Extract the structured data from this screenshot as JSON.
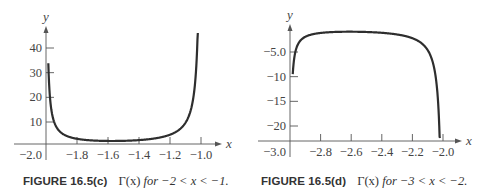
{
  "chart_data": [
    {
      "type": "line",
      "title": "",
      "caption_label": "FIGURE 16.5(c)",
      "caption_text": "Γ(x) for −2 < x < −1.",
      "xlabel": "x",
      "ylabel": "y",
      "function": "Gamma(x)",
      "xlim": [
        -2.0,
        -1.0
      ],
      "ylim": [
        0,
        45
      ],
      "x_ticks": [
        -2.0,
        -1.8,
        -1.6,
        -1.4,
        -1.2,
        -1.0
      ],
      "x_tick_labels": [
        "−2.0",
        "−1.8",
        "−1.6",
        "−1.4",
        "−1.2",
        "−1.0"
      ],
      "y_ticks": [
        10,
        20,
        30,
        40
      ],
      "y_tick_labels": [
        "10",
        "20",
        "30",
        "40"
      ],
      "grid": false,
      "series": [
        {
          "name": "Γ(x)",
          "x": [
            -1.98,
            -1.95,
            -1.9,
            -1.8,
            -1.7,
            -1.6,
            -1.5,
            -1.4,
            -1.3,
            -1.2,
            -1.1,
            -1.05,
            -1.02
          ],
          "values": [
            25.7,
            10.9,
            5.85,
            3.27,
            2.54,
            2.31,
            2.36,
            2.66,
            3.33,
            4.85,
            9.71,
            19.47,
            49.48
          ]
        }
      ]
    },
    {
      "type": "line",
      "title": "",
      "caption_label": "FIGURE 16.5(d)",
      "caption_text": "Γ(x) for −3 < x < −2.",
      "xlabel": "x",
      "ylabel": "y",
      "function": "Gamma(x)",
      "xlim": [
        -3.0,
        -2.0
      ],
      "ylim": [
        -23,
        0
      ],
      "x_ticks": [
        -3.0,
        -2.8,
        -2.6,
        -2.4,
        -2.2,
        -2.0
      ],
      "x_tick_labels": [
        "−3.0",
        "−2.8",
        "−2.6",
        "−2.4",
        "−2.2",
        "−2.0"
      ],
      "y_ticks": [
        -5,
        -10,
        -15,
        -20
      ],
      "y_tick_labels": [
        "−5.0",
        "−10",
        "−15",
        "−20"
      ],
      "grid": false,
      "series": [
        {
          "name": "Γ(x)",
          "x": [
            -2.97,
            -2.95,
            -2.9,
            -2.8,
            -2.7,
            -2.6,
            -2.5,
            -2.4,
            -2.3,
            -2.2,
            -2.1,
            -2.05,
            -2.02
          ],
          "values": [
            -7.61,
            -3.71,
            -1.96,
            -1.16,
            -0.95,
            -0.89,
            -0.95,
            -1.11,
            -1.45,
            -2.2,
            -4.63,
            -9.5,
            -24.51
          ]
        }
      ]
    }
  ],
  "figures": {
    "c": {
      "label": "FIGURE 16.5(c)",
      "gamma": "Γ(x)",
      "range_text": "for −2 < x < −1."
    },
    "d": {
      "label": "FIGURE 16.5(d)",
      "gamma": "Γ(x)",
      "range_text": "for −3 < x < −2."
    }
  },
  "colors": {
    "curve": "#2e2e2e",
    "axis": "#555555",
    "text": "#444444"
  }
}
